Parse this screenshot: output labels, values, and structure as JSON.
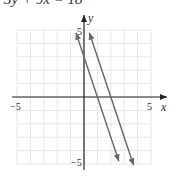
{
  "equation": "3y + 9x = 18",
  "chart_data": {
    "type": "line",
    "title": "3y + 9x = 18",
    "xlabel": "x",
    "ylabel": "y",
    "xlim": [
      -5,
      5
    ],
    "ylim": [
      -5,
      5
    ],
    "grid": true,
    "tick_labels": {
      "x": [
        "-5",
        "5"
      ],
      "y": [
        "5",
        "-5"
      ]
    },
    "series": [
      {
        "name": "y = 3 - 3x",
        "x": [
          -0.6,
          2.6
        ],
        "y": [
          4.8,
          -4.8
        ]
      },
      {
        "name": "3y + 9x = 18 (y = 6 - 3x)",
        "x": [
          0.4,
          3.7
        ],
        "y": [
          4.8,
          -5.1
        ]
      }
    ],
    "colors": {
      "grid": "#e6e6e6",
      "axes": "#222222",
      "lines": "#666666"
    }
  }
}
